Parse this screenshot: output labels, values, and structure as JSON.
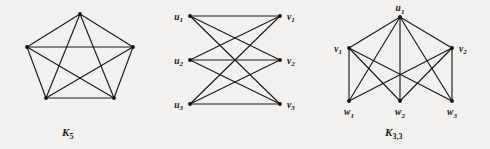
{
  "figure": {
    "background_color": "#f2f1ef",
    "ink_color": "#1a1a1a",
    "width": 490,
    "height": 149
  },
  "panels": [
    {
      "id": "k5",
      "caption_base": "K",
      "caption_sub": "5",
      "vertices": [
        {
          "id": "a",
          "label": "",
          "sub": "",
          "x": 80,
          "y": 14
        },
        {
          "id": "b",
          "label": "",
          "sub": "",
          "x": 133,
          "y": 47
        },
        {
          "id": "c",
          "label": "",
          "sub": "",
          "x": 114,
          "y": 98
        },
        {
          "id": "d",
          "label": "",
          "sub": "",
          "x": 46,
          "y": 98
        },
        {
          "id": "e",
          "label": "",
          "sub": "",
          "x": 27,
          "y": 47
        }
      ],
      "edges": [
        [
          "a",
          "b"
        ],
        [
          "b",
          "c"
        ],
        [
          "c",
          "d"
        ],
        [
          "d",
          "e"
        ],
        [
          "e",
          "a"
        ],
        [
          "a",
          "c"
        ],
        [
          "a",
          "d"
        ],
        [
          "b",
          "d"
        ],
        [
          "b",
          "e"
        ],
        [
          "c",
          "e"
        ]
      ],
      "edge_count": 10,
      "vertex_count": 5
    },
    {
      "id": "k33",
      "caption_base": "K",
      "caption_sub": "3,3",
      "vertices": [
        {
          "id": "u1",
          "label": "u",
          "sub": "1",
          "x": 27,
          "y": 16,
          "label_side": "left"
        },
        {
          "id": "u2",
          "label": "u",
          "sub": "2",
          "x": 27,
          "y": 60,
          "label_side": "left"
        },
        {
          "id": "u3",
          "label": "u",
          "sub": "3",
          "x": 27,
          "y": 104,
          "label_side": "left"
        },
        {
          "id": "v1",
          "label": "v",
          "sub": "1",
          "x": 117,
          "y": 16,
          "label_side": "right"
        },
        {
          "id": "v2",
          "label": "v",
          "sub": "2",
          "x": 117,
          "y": 60,
          "label_side": "right"
        },
        {
          "id": "v3",
          "label": "v",
          "sub": "3",
          "x": 117,
          "y": 104,
          "label_side": "right"
        }
      ],
      "edges": [
        [
          "u1",
          "v1"
        ],
        [
          "u1",
          "v2"
        ],
        [
          "u1",
          "v3"
        ],
        [
          "u2",
          "v1"
        ],
        [
          "u2",
          "v2"
        ],
        [
          "u2",
          "v3"
        ],
        [
          "u3",
          "v1"
        ],
        [
          "u3",
          "v2"
        ],
        [
          "u3",
          "v3"
        ]
      ],
      "edge_count": 9,
      "vertex_count": 6
    },
    {
      "id": "k321",
      "caption_base": "K",
      "caption_sub": "3,2,1",
      "vertices": [
        {
          "id": "u1",
          "label": "u",
          "sub": "1",
          "x": 90,
          "y": 17,
          "label_side": "above"
        },
        {
          "id": "v1",
          "label": "v",
          "sub": "1",
          "x": 39,
          "y": 48,
          "label_side": "left"
        },
        {
          "id": "v2",
          "label": "v",
          "sub": "2",
          "x": 142,
          "y": 48,
          "label_side": "right"
        },
        {
          "id": "w1",
          "label": "w",
          "sub": "1",
          "x": 39,
          "y": 101,
          "label_side": "below"
        },
        {
          "id": "w2",
          "label": "w",
          "sub": "2",
          "x": 90,
          "y": 101,
          "label_side": "below"
        },
        {
          "id": "w3",
          "label": "w",
          "sub": "3",
          "x": 142,
          "y": 101,
          "label_side": "below"
        }
      ],
      "edges": [
        [
          "u1",
          "v1"
        ],
        [
          "u1",
          "v2"
        ],
        [
          "u1",
          "w1"
        ],
        [
          "u1",
          "w2"
        ],
        [
          "u1",
          "w3"
        ],
        [
          "v1",
          "w1"
        ],
        [
          "v1",
          "w2"
        ],
        [
          "v1",
          "w3"
        ],
        [
          "v2",
          "w1"
        ],
        [
          "v2",
          "w2"
        ],
        [
          "v2",
          "w3"
        ]
      ],
      "edge_count": 11,
      "vertex_count": 6
    }
  ]
}
